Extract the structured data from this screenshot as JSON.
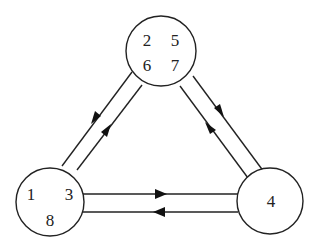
{
  "diagram": {
    "type": "state-graph",
    "colors": {
      "stroke": "#222222",
      "background": "#ffffff"
    },
    "nodes": [
      {
        "id": "top",
        "labels": [
          "2",
          "5",
          "6",
          "7"
        ]
      },
      {
        "id": "left",
        "labels": [
          "1",
          "3",
          "8"
        ]
      },
      {
        "id": "right",
        "labels": [
          "4"
        ]
      }
    ],
    "edges": [
      {
        "from": "top",
        "to": "left"
      },
      {
        "from": "left",
        "to": "top"
      },
      {
        "from": "top",
        "to": "right"
      },
      {
        "from": "right",
        "to": "top"
      },
      {
        "from": "left",
        "to": "right"
      },
      {
        "from": "right",
        "to": "left"
      }
    ]
  }
}
